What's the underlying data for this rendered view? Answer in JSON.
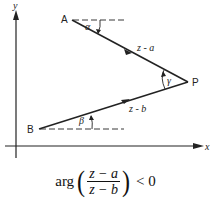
{
  "diagram": {
    "axes": {
      "x_label": "x",
      "y_label": "y"
    },
    "points": {
      "A": {
        "label": "A"
      },
      "B": {
        "label": "B"
      },
      "P": {
        "label": "P"
      }
    },
    "vectors": {
      "AP": {
        "label": "z - a"
      },
      "BP": {
        "label": "z - b"
      }
    },
    "angles": {
      "alpha": "α",
      "beta": "β",
      "gamma": "γ"
    },
    "colors": {
      "stroke": "#222222",
      "background": "#ffffff"
    }
  },
  "formula": {
    "function": "arg",
    "numerator": "z − a",
    "denominator": "z − b",
    "open_paren": "(",
    "close_paren": ")",
    "relation": "< 0"
  }
}
